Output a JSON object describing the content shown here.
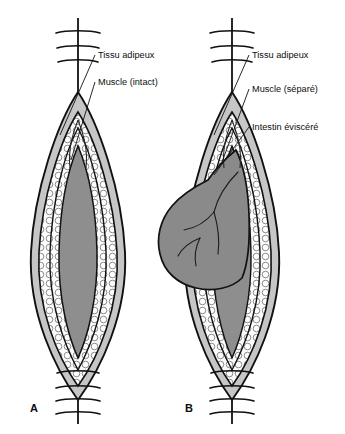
{
  "figure": {
    "type": "medical-illustration",
    "language": "French",
    "background_color": "#ffffff"
  },
  "colors": {
    "outline": "#111111",
    "skin_layer": "#c6c6c6",
    "fat_layer": "#fbfbfb",
    "fat_cell_outline": "#6e6e6e",
    "muscle_layer": "#8e8e8e",
    "intestine": "#8a8a8a",
    "text": "#0d0d0d"
  },
  "panels": [
    {
      "id": "A",
      "letter": "A",
      "letter_x": 30,
      "letter_y": 412,
      "center_x": 78,
      "condition": "intact",
      "labels": [
        {
          "id": "tissu-adipeux-a",
          "text": "Tissu adipeux",
          "text_x": 98,
          "text_y": 58,
          "leader_from": [
            95,
            55
          ],
          "leader_to": [
            60,
            135
          ]
        },
        {
          "id": "muscle-intact-a",
          "text": "Muscle (intact)",
          "text_x": 98,
          "text_y": 85,
          "leader_from": [
            95,
            82
          ],
          "leader_to": [
            71,
            160
          ]
        }
      ],
      "sutures": {
        "top_count": 3,
        "bottom_count": 4
      }
    },
    {
      "id": "B",
      "letter": "B",
      "letter_x": 185,
      "letter_y": 412,
      "center_x": 232,
      "condition": "eviscerated",
      "labels": [
        {
          "id": "tissu-adipeux-b",
          "text": "Tissu adipeux",
          "text_x": 252,
          "text_y": 58,
          "leader_from": [
            249,
            55
          ],
          "leader_to": [
            214,
            135
          ]
        },
        {
          "id": "muscle-separe-b",
          "text": "Muscle (séparé)",
          "text_x": 252,
          "text_y": 92,
          "leader_from": [
            249,
            89
          ],
          "leader_to": [
            222,
            162
          ]
        },
        {
          "id": "intestin-eviscere-b",
          "text": "Intestin éviscéré",
          "text_x": 252,
          "text_y": 130,
          "leader_from": [
            249,
            127
          ],
          "leader_to": [
            214,
            175
          ]
        }
      ],
      "sutures": {
        "top_count": 3,
        "bottom_count": 4
      }
    }
  ]
}
